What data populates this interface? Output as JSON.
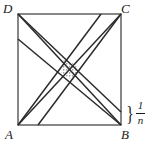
{
  "figure": {
    "type": "geometry-diagram",
    "vertices": {
      "A": "A",
      "B": "B",
      "C": "C",
      "D": "D"
    },
    "annotation": {
      "brace": "}",
      "fraction_numerator": "1",
      "fraction_denominator": "n"
    },
    "colors": {
      "stroke": "#2b2b2b",
      "square_stroke": "#555555",
      "shade_fill": "#cfcfcf",
      "background": "#ffffff"
    },
    "geometry": {
      "square": {
        "x1": 18,
        "y1": 14,
        "x2": 121,
        "y2": 125
      },
      "segments": [
        {
          "name": "A-to-C",
          "x1": 18,
          "y1": 125,
          "x2": 121,
          "y2": 14
        },
        {
          "name": "D-to-B",
          "x1": 18,
          "y1": 14,
          "x2": 121,
          "y2": 125
        },
        {
          "name": "offset-bottom-to-C",
          "x1": 38,
          "y1": 125,
          "x2": 121,
          "y2": 14
        },
        {
          "name": "left-offset-to-B",
          "x1": 18,
          "y1": 39,
          "x2": 121,
          "y2": 125
        },
        {
          "name": "D-to-right-offset",
          "x1": 18,
          "y1": 14,
          "x2": 121,
          "y2": 112
        },
        {
          "name": "A-to-top-offset",
          "x1": 18,
          "y1": 125,
          "x2": 101,
          "y2": 14
        }
      ],
      "shaded_polygon": [
        {
          "x": 64,
          "y": 59
        },
        {
          "x": 78,
          "y": 66
        },
        {
          "x": 74,
          "y": 81
        },
        {
          "x": 61,
          "y": 73
        }
      ]
    }
  }
}
